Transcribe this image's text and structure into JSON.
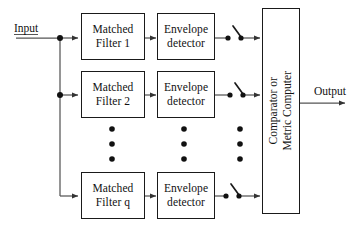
{
  "diagram": {
    "type": "block-diagram",
    "colors": {
      "stroke": "#1a1a1a",
      "line": "#555555",
      "background": "#ffffff",
      "text": "#111111"
    },
    "input": {
      "label": "Input",
      "underlined": true
    },
    "output": {
      "label": "Output"
    },
    "branches": [
      {
        "id": "branch-1",
        "matched_filter": {
          "line1": "Matched",
          "line2": "Filter 1"
        },
        "envelope_detector": {
          "line1": "Envelope",
          "line2": "detector"
        },
        "switch": {
          "name": "sampling-switch",
          "state": "open"
        }
      },
      {
        "id": "branch-2",
        "matched_filter": {
          "line1": "Matched",
          "line2": "Filter 2"
        },
        "envelope_detector": {
          "line1": "Envelope",
          "line2": "detector"
        },
        "switch": {
          "name": "sampling-switch",
          "state": "open"
        }
      },
      {
        "id": "branch-q",
        "matched_filter": {
          "line1": "Matched",
          "line2": "Filter q"
        },
        "envelope_detector": {
          "line1": "Envelope",
          "line2": "detector"
        },
        "switch": {
          "name": "sampling-switch",
          "state": "open"
        }
      }
    ],
    "ellipsis": {
      "columns": 3,
      "dots_per_column": 3,
      "meaning": "additional branches between 2 and q"
    },
    "comparator": {
      "line1": "Comparator or",
      "line2": "Metric Computer",
      "orientation": "vertical"
    }
  }
}
